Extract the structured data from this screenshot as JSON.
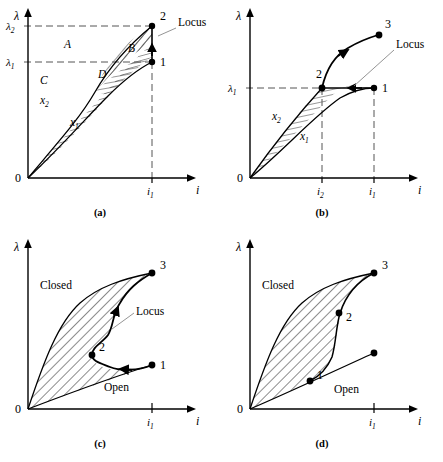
{
  "figure": {
    "type": "technical-diagram",
    "axis": {
      "y_symbol": "λ",
      "x_symbol": "i",
      "origin_label": "0"
    },
    "colors": {
      "ink": "#000000",
      "dashed": "#555555",
      "leader": "#888888",
      "background": "#ffffff"
    }
  },
  "panels": [
    {
      "id": "a",
      "caption": "(a)",
      "y_ticks": [
        {
          "label": "λ",
          "sub": "1"
        },
        {
          "label": "λ",
          "sub": "2"
        }
      ],
      "x_ticks": [
        {
          "label": "i",
          "sub": "1"
        }
      ],
      "points": [
        {
          "name": "1",
          "label": "1"
        },
        {
          "name": "2",
          "label": "2"
        }
      ],
      "regions": [
        {
          "name": "A",
          "label": "A"
        },
        {
          "name": "B",
          "label": "B"
        },
        {
          "name": "C",
          "label": "C"
        },
        {
          "name": "D",
          "label": "D"
        }
      ],
      "curves": [
        {
          "name": "x1",
          "label": "x",
          "sub": "1"
        },
        {
          "name": "x2",
          "label": "x",
          "sub": "2"
        }
      ],
      "annotations": [
        {
          "name": "locus",
          "label": "Locus"
        }
      ]
    },
    {
      "id": "b",
      "caption": "(b)",
      "y_ticks": [
        {
          "label": "λ",
          "sub": "1"
        }
      ],
      "x_ticks": [
        {
          "label": "i",
          "sub": "2"
        },
        {
          "label": "i",
          "sub": "1"
        }
      ],
      "points": [
        {
          "name": "1",
          "label": "1"
        },
        {
          "name": "2",
          "label": "2"
        },
        {
          "name": "3",
          "label": "3"
        }
      ],
      "regions": [],
      "curves": [
        {
          "name": "x1",
          "label": "x",
          "sub": "1"
        },
        {
          "name": "x2",
          "label": "x",
          "sub": "2"
        }
      ],
      "annotations": [
        {
          "name": "locus",
          "label": "Locus"
        }
      ]
    },
    {
      "id": "c",
      "caption": "(c)",
      "y_ticks": [],
      "x_ticks": [
        {
          "label": "i",
          "sub": "1"
        }
      ],
      "points": [
        {
          "name": "1",
          "label": "1"
        },
        {
          "name": "2",
          "label": "2"
        },
        {
          "name": "3",
          "label": "3"
        }
      ],
      "regions": [
        {
          "name": "closed",
          "label": "Closed"
        },
        {
          "name": "open",
          "label": "Open"
        }
      ],
      "curves": [],
      "annotations": [
        {
          "name": "locus",
          "label": "Locus"
        }
      ]
    },
    {
      "id": "d",
      "caption": "(d)",
      "y_ticks": [],
      "x_ticks": [
        {
          "label": "i",
          "sub": "1"
        }
      ],
      "points": [
        {
          "name": "1",
          "label": "1"
        },
        {
          "name": "2",
          "label": "2"
        },
        {
          "name": "3",
          "label": "3"
        }
      ],
      "regions": [
        {
          "name": "closed",
          "label": "Closed"
        },
        {
          "name": "open",
          "label": "Open"
        }
      ],
      "curves": [],
      "annotations": []
    }
  ]
}
